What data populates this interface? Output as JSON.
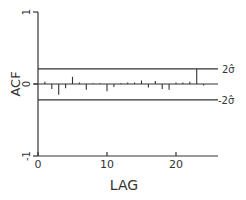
{
  "chart_data": {
    "type": "bar",
    "title": "",
    "xlabel": "LAG",
    "ylabel": "ACF",
    "xlim": [
      0,
      26
    ],
    "ylim": [
      -1,
      1
    ],
    "x_ticks": [
      0,
      10,
      20
    ],
    "x_tick_labels": [
      "0",
      "10",
      "20"
    ],
    "y_ticks": [
      -1,
      0,
      1
    ],
    "y_tick_labels": [
      "-1",
      "0",
      "1"
    ],
    "grid": false,
    "legend": null,
    "x": [
      1,
      2,
      3,
      4,
      5,
      6,
      7,
      8,
      9,
      10,
      11,
      12,
      13,
      14,
      15,
      16,
      17,
      18,
      19,
      20,
      21,
      22,
      23,
      24
    ],
    "values": [
      0.03,
      -0.07,
      -0.15,
      -0.06,
      0.1,
      0.02,
      -0.08,
      0.01,
      0.01,
      -0.1,
      -0.04,
      0.01,
      0.02,
      0.02,
      0.05,
      -0.05,
      0.04,
      -0.07,
      -0.08,
      0.02,
      0.02,
      0.03,
      0.21,
      -0.02
    ],
    "confidence_bounds": {
      "upper": 0.21,
      "lower": -0.22,
      "upper_label": "2σ̂",
      "lower_label": "-2σ̂"
    }
  },
  "colors": {
    "ink": "#333333",
    "background": "#ffffff"
  }
}
